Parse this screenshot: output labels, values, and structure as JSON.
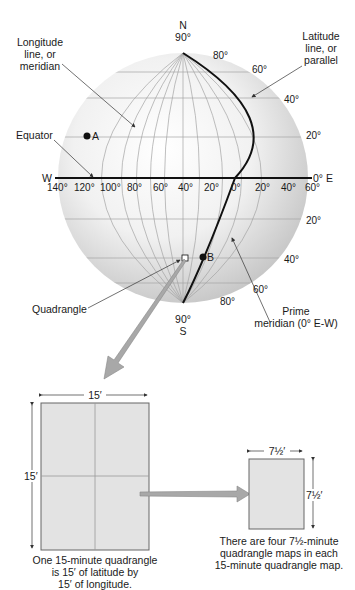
{
  "globe": {
    "north_letter": "N",
    "north_deg": "90°",
    "south_deg": "90°",
    "south_letter": "S",
    "west_letter": "W",
    "east_label": "0° E",
    "point_a": "A",
    "point_b": "B",
    "longitude_ticks": [
      "140°",
      "120°",
      "100°",
      "80°",
      "60°",
      "40°",
      "20°",
      "0°",
      "20°",
      "40°",
      "60°"
    ],
    "latitude_north_ticks": [
      "80°",
      "60°",
      "40°",
      "20°"
    ],
    "latitude_south_ticks": [
      "20°",
      "40°",
      "60°",
      "80°"
    ]
  },
  "callouts": {
    "longitude": [
      "Longitude",
      "line, or",
      "meridian"
    ],
    "latitude": [
      "Latitude",
      "line, or",
      "parallel"
    ],
    "equator": "Equator",
    "prime_meridian": [
      "Prime",
      "meridian (0° E-W)"
    ],
    "quadrangle": "Quadrangle"
  },
  "big_quad": {
    "width_label": "15′",
    "height_label": "15′",
    "caption": [
      "One 15-minute quadrangle",
      "is 15′ of latitude by",
      "15′ of longitude."
    ]
  },
  "small_quad": {
    "width_label": "7½′",
    "height_label": "7½′",
    "caption": [
      "There are four 7½-minute",
      "quadrangle maps in each",
      "15-minute quadrangle map."
    ]
  },
  "colors": {
    "globe_light": "#ffffff",
    "globe_dark": "#c9c9c9",
    "grid": "#9a9a9a",
    "quad_fill": "#e3e3e3",
    "arrow_fill": "#a8a8a8"
  }
}
